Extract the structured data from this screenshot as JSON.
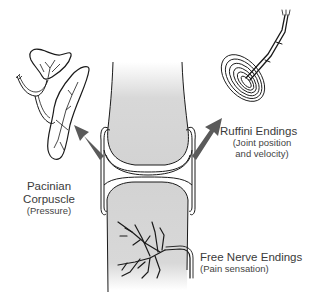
{
  "diagram": {
    "colors": {
      "bone_fill": "#d6d6d6",
      "outline": "#1a1a1a",
      "arrow": "#5a5a5a",
      "background": "#ffffff"
    },
    "structures": [
      {
        "id": "upper-bone",
        "description": "upper bone end"
      },
      {
        "id": "lower-bone",
        "description": "lower bone end"
      },
      {
        "id": "joint-capsule",
        "description": "joint capsule"
      }
    ],
    "labels": {
      "pacinian": {
        "title_line1": "Pacinian",
        "title_line2": "Corpuscle",
        "sub": "(Pressure)"
      },
      "ruffini": {
        "title": "Ruffini Endings",
        "sub_line1": "(Joint position",
        "sub_line2": "and velocity)"
      },
      "free_nerve": {
        "title": "Free Nerve Endings",
        "sub": "(Pain sensation)"
      }
    }
  }
}
